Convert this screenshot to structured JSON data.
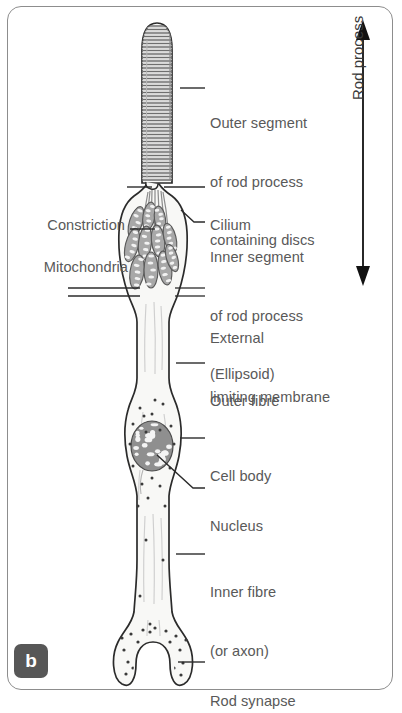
{
  "figure": {
    "panel_label": "b",
    "background_color": "#ffffff",
    "frame_color": "#8d8d8d",
    "ink_color": "#2b2b2b",
    "label_text_color": "#595959",
    "fill_color": "#f7f7f5",
    "organelle_color": "#9a9a9a"
  },
  "scale_bar": {
    "label": "Rod process",
    "orientation": "vertical",
    "arrow_style": "double-headed",
    "top_y": 28,
    "bottom_y": 278
  },
  "labels": {
    "outer_segment": {
      "lines": [
        "Outer segment",
        "of rod process",
        "containing discs"
      ],
      "side": "right",
      "text_x": 210,
      "text_y": 75,
      "leader_from_x": 180,
      "leader_to_x": 205,
      "leader_y": 88,
      "target_x": 180,
      "target_y": 88
    },
    "cilium": {
      "lines": [
        "Cilium"
      ],
      "side": "right",
      "text_x": 210,
      "text_y": 177,
      "leader_from_x": 164,
      "leader_to_x": 205,
      "leader_y": 187,
      "target_x": 164,
      "target_y": 187
    },
    "inner_segment": {
      "lines": [
        "Inner segment",
        "of rod process",
        "(Ellipsoid)"
      ],
      "side": "right",
      "text_x": 210,
      "text_y": 209,
      "leader_from_x": 178,
      "leader_to_x": 205,
      "leader_y": 222,
      "target_x": 178,
      "target_y": 222
    },
    "external_limiting_membrane": {
      "lines": [
        "External",
        "limiting membrane"
      ],
      "side": "right",
      "text_x": 210,
      "text_y": 290,
      "double_line": true,
      "line_y_a": 288,
      "line_y_b": 296,
      "right_from_x": 175,
      "right_to_x": 205,
      "left_from_x": 68,
      "left_to_x": 140
    },
    "outer_fibre": {
      "lines": [
        "Outer fibre"
      ],
      "side": "right",
      "text_x": 210,
      "text_y": 353,
      "leader_from_x": 176,
      "leader_to_x": 205,
      "leader_y": 363,
      "target_x": 176,
      "target_y": 363
    },
    "cell_body": {
      "lines": [
        "Cell body"
      ],
      "side": "right",
      "text_x": 210,
      "text_y": 428,
      "leader_from_x": 180,
      "leader_to_x": 205,
      "leader_y": 438,
      "target_x": 180,
      "target_y": 438
    },
    "nucleus": {
      "lines": [
        "Nucleus"
      ],
      "side": "right",
      "text_x": 210,
      "text_y": 478,
      "leader_from_x": 157,
      "leader_to_x": 205,
      "leader_y": 488,
      "target_x": 157,
      "target_y": 455
    },
    "inner_fibre": {
      "lines": [
        "Inner fibre",
        "(or axon)"
      ],
      "side": "right",
      "text_x": 210,
      "text_y": 544,
      "leader_from_x": 176,
      "leader_to_x": 205,
      "leader_y": 554,
      "target_x": 176,
      "target_y": 554
    },
    "rod_synapse": {
      "lines": [
        "Rod synapse"
      ],
      "side": "right",
      "text_x": 210,
      "text_y": 653,
      "leader_from_x": 178,
      "leader_to_x": 205,
      "leader_y": 662,
      "target_x": 178,
      "target_y": 662
    },
    "constriction": {
      "lines": [
        "Constriction"
      ],
      "side": "left",
      "text_x": 32,
      "text_y": 177,
      "leader_from_x": 127,
      "leader_to_x": 152,
      "leader_y": 187,
      "target_x": 152,
      "target_y": 187
    },
    "mitochondria": {
      "lines": [
        "Mitochondria"
      ],
      "side": "left",
      "text_x": 16,
      "text_y": 219,
      "leader_from_x": 130,
      "leader_to_x": 155,
      "leader_y": 229,
      "target_x": 155,
      "target_y": 229
    }
  },
  "structure": {
    "outer_segment": {
      "name": "outer-segment",
      "top_y": 22,
      "bottom_y": 182,
      "left_x": 142,
      "right_x": 172,
      "disc_count": 44,
      "disc_spacing": 3.6
    },
    "constriction": {
      "y": 186,
      "x": 152
    },
    "cilium": {
      "line_count": 7,
      "top_y": 188,
      "bottom_y": 228
    },
    "ellipsoid": {
      "top_y": 190,
      "bottom_y": 300,
      "max_width": 62,
      "mitochondria_count": 11
    },
    "outer_fibre": {
      "top_y": 300,
      "bottom_y": 400,
      "width": 30
    },
    "cell_body": {
      "center_y": 452,
      "width": 66,
      "top_y": 400,
      "bottom_y": 510
    },
    "nucleus": {
      "cx": 152,
      "cy": 446,
      "rx": 21,
      "ry": 25,
      "speckle_count": 22
    },
    "inner_fibre": {
      "top_y": 510,
      "bottom_y": 620,
      "width": 34
    },
    "rod_synapse": {
      "top_y": 620,
      "bottom_y": 686,
      "width": 66,
      "notch_depth": 30
    }
  }
}
